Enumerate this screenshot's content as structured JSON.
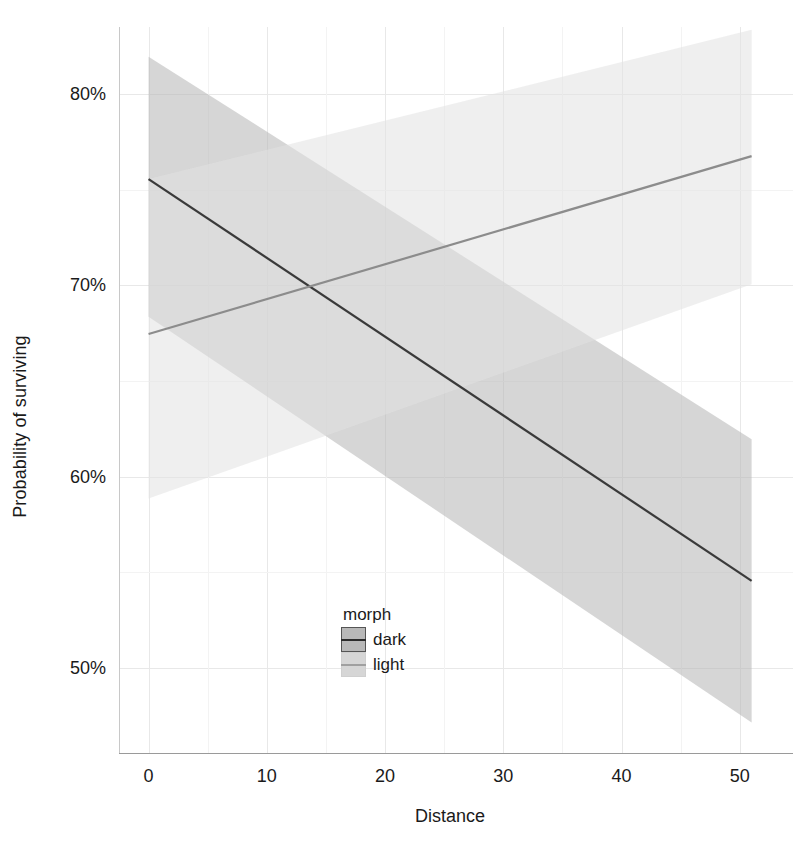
{
  "chart_data": {
    "type": "line",
    "title": "",
    "subtitle": "",
    "xlabel": "Distance",
    "ylabel": "Probability of surviving",
    "xlim": [
      -2.5,
      54.5
    ],
    "ylim": [
      0.455,
      0.835
    ],
    "grid": true,
    "x_ticks": [
      0,
      10,
      20,
      30,
      40,
      50
    ],
    "x_tick_labels": [
      "0",
      "10",
      "20",
      "30",
      "40",
      "50"
    ],
    "x_minor_ticks": [
      5,
      15,
      25,
      35,
      45
    ],
    "y_ticks": [
      0.5,
      0.6,
      0.7,
      0.8
    ],
    "y_tick_labels": [
      "50%",
      "60%",
      "70%",
      "80%"
    ],
    "y_minor_ticks": [
      0.55,
      0.65,
      0.75
    ],
    "legend": {
      "title": "morph",
      "position": "inside-bottom-left",
      "entries": [
        "dark",
        "light"
      ]
    },
    "series": [
      {
        "name": "dark",
        "color": "#3a3a3a",
        "ribbon_color": "#b4b4b4",
        "ribbon_opacity": 0.55,
        "x": [
          0,
          51
        ],
        "y": [
          0.7555,
          0.5455
        ],
        "ribbon_low": [
          0.6835,
          0.4715
        ],
        "ribbon_high": [
          0.8195,
          0.6195
        ]
      },
      {
        "name": "light",
        "color": "#8c8c8c",
        "ribbon_color": "#e2e2e2",
        "ribbon_opacity": 0.55,
        "x": [
          0,
          51
        ],
        "y": [
          0.6745,
          0.7675
        ],
        "ribbon_low": [
          0.5885,
          0.7005
        ],
        "ribbon_high": [
          0.7555,
          0.8335
        ]
      }
    ],
    "annotations": []
  },
  "axes": {
    "x_title": "Distance",
    "y_title": "Probability of surviving"
  },
  "legend": {
    "title": "morph",
    "items": [
      {
        "label": "dark",
        "fill": "#b8b8b8",
        "line": "#2b2b2b",
        "border": "#555555"
      },
      {
        "label": "light",
        "fill": "#d6d6d6",
        "line": "#a0a0a0",
        "border": "#cfcfcf"
      }
    ]
  },
  "colors": {
    "background": "#ffffff",
    "grid_major": "#e8e8e8",
    "grid_minor": "#f3f3f3",
    "panel_border": "#c8c8c8",
    "text": "#1a1a1a",
    "dark_line": "#3a3a3a",
    "light_line": "#8c8c8c",
    "dark_ribbon": "#b4b4b4",
    "light_ribbon": "#e2e2e2"
  }
}
